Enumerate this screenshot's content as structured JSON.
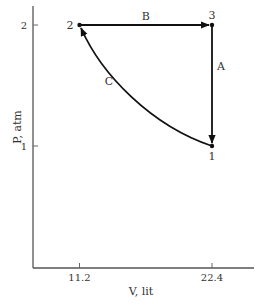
{
  "chart_data": {
    "type": "diagram",
    "title": "",
    "xlabel": "V, lit",
    "ylabel": "P, atm",
    "xlim": [
      7.2,
      23.8
    ],
    "ylim": [
      0,
      2.15
    ],
    "x_ticks": [
      {
        "value": 11.2,
        "label": "11.2"
      },
      {
        "value": 22.4,
        "label": "22.4"
      }
    ],
    "y_ticks": [
      {
        "value": 1,
        "label": "1"
      },
      {
        "value": 2,
        "label": "2"
      }
    ],
    "states": [
      {
        "id": "1",
        "label": "1",
        "V": 22.4,
        "P": 1
      },
      {
        "id": "2",
        "label": "2",
        "V": 11.2,
        "P": 2
      },
      {
        "id": "3",
        "label": "3",
        "V": 22.4,
        "P": 2
      }
    ],
    "processes": [
      {
        "label": "B",
        "from": "2",
        "to": "3",
        "kind": "isobaric",
        "shape": "straight"
      },
      {
        "label": "A",
        "from": "3",
        "to": "1",
        "kind": "isochoric",
        "shape": "straight"
      },
      {
        "label": "C",
        "from": "1",
        "to": "2",
        "kind": "isothermal",
        "shape": "curve"
      }
    ],
    "colors": {
      "line": "#111111",
      "axis": "#555555",
      "text": "#333333"
    }
  }
}
